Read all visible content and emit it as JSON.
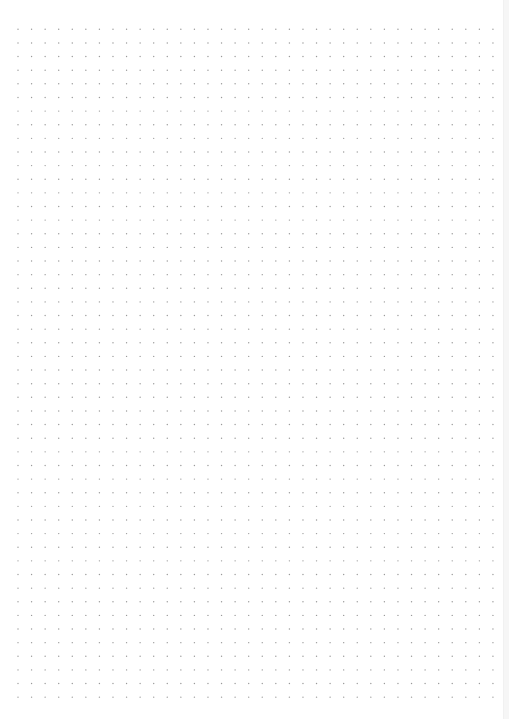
{
  "page": {
    "type": "dot-grid",
    "background_color": "#ffffff",
    "dot_color": "#9a9a9a",
    "dot_radius": 0.7,
    "columns": 36,
    "rows": 50,
    "origin_x": 18,
    "origin_y": 29.3,
    "spacing_x": 13.57,
    "spacing_y": 13.63
  },
  "edge": {
    "color": "#f6f6f6"
  },
  "corner_mark": ""
}
